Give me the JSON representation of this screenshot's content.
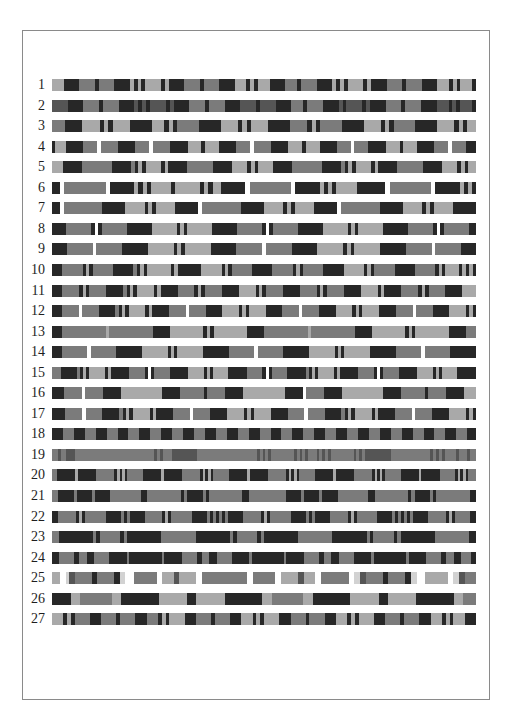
{
  "figure": {
    "palette": {
      "L": "#a9a9a9",
      "M": "#7b7b7b",
      "D": "#272727",
      "W": "#ffffff",
      "P": "#d2d2d2",
      "G": "#555555"
    },
    "rows": [
      {
        "label": "1",
        "pattern": "L3 D4 M4 D1 M4 D4 L1 D1 L1 D1 L4 D1 L1 D1 D3 M4 D1 M4 D4 L3 D1 L1 D1 L3 D4 M3 D1 M4 D4 L1 D1 L1 D1 L4 D1 L1 D4 M4 D1 M4 D4 L3 D1 L1 D1 L3 D1"
      },
      {
        "label": "2",
        "pattern": "G4 D4 M4 D1 M4 D4 G1 D1 G1 D1 G4 D1 G1 D4 M4 D1 M4 D4 G4 D1 G4 D4 M3 D1 M4 D4 G1 D1 G4 D1 G1 D4 M4 D1 M4 D4 G3 D1 G1 D1 G3 D1"
      },
      {
        "label": "3",
        "pattern": "M3 D4 L4 D1 L1 D1 L4 D5 L3 D1 L1 D1 M5 D5 L4 D1 L1 D1 L4 D5 M4 D1 L1 D1 M5 D5 L4 D1 L1 D1 M5 D5 L4 D1 L1 D1 L2"
      },
      {
        "label": "4",
        "pattern": "D1 L3 D5 M4 W1 M5 D5 M4 W1 M5 D5 L4 D1 L4 D5 M4 W1 M5 D5 L4 D1 L4 D5 M4 W1 M4 D5 L4 D1 L4 D5 M4 W1 M4 D3"
      },
      {
        "label": "5",
        "pattern": "L3 D5 M8 D5 M1 D1 L1 D1 L4 D1 L1 D5 M7 D5 L4 D1 L1 D1 L4 D5 M8 D5 M1 D1 L1 D1 L4 D1 L1 D5 M7 D5 L4 D1 L1 D1 L2"
      },
      {
        "label": "6",
        "pattern": "D2 W1 M10 W1 D6 L1 D1 L1 D1 L5 D1 L6 D1 L1 D1 L2 D6 W1 M10 W1 D6 L1 D1 L1 D1 L5 D7 W1 M10 W1 D6 L1 D1 L1 D1"
      },
      {
        "label": "7",
        "pattern": "D2 W1 M10 D6 L5 D1 L1 D1 L5 D6 W1 M10 D6 L5 D1 L1 D1 L5 D6 W1 M10 D6 L5 D1 L1 D1 L5 D6"
      },
      {
        "label": "8",
        "pattern": "D4 M7 D1 W1 D1 M7 D7 L7 D1 L1 D1 L7 D7 M7 D1 W1 D1 M7 D7 L7 D1 L1 D1 L7 D7 M7 D1 W1 D1 M7 D2"
      },
      {
        "label": "9",
        "pattern": "D4 M7 W1 M7 D7 L7 D1 L1 D1 L7 D7 M7 W1 M7 D7 L7 D1 L1 D1 L7 D7 M7 W1 M7 D4"
      },
      {
        "label": "10",
        "pattern": "D3 M6 D1 L1 D1 M6 D6 M1 D1 L1 D1 L7 D1 L1 D1 D6 L6 D1 L1 D1 M6 D6 M6 D1 L1 D1 M6 D6 L6 D1 L1 D1 M6 D6 M6 D1 L1 D1 L4 D1 L1 D1 L1 D1"
      },
      {
        "label": "11",
        "pattern": "D3 M5 D1 L1 D1 M5 D5 M1 D1 L1 D1 L5 D1 L1 D5 M5 D1 L1 D1 M5 D5 L5 D1 L1 D1 M5 D5 M5 D1 L1 D1 M5 D5 L5 D1 L1 D5 M5 D1 L1 D1 M5 D5 L4"
      },
      {
        "label": "12",
        "pattern": "D3 M5 W1 M5 D5 M1 D1 L1 D1 L5 D1 L1 D5 M5 W1 M5 D5 L5 D1 L1 D1 L5 D5 M5 W1 M5 D5 L5 D1 L1 D1 L5 D5 M5 W1 M5 D5 L5 D1 L1 D1"
      },
      {
        "label": "13",
        "pattern": "D3 M13 L1 M13 D5 L10 D1 L1 D1 L10 D5 M13 L1 M13 D5 L10 D1 L1 D1 L10 D5 M3"
      },
      {
        "label": "14",
        "pattern": "D3 M8 W1 M8 D8 L8 D1 L1 D1 L8 D8 M8 W1 M8 D8 L8 D1 L1 D1 L8 D8 M8 W1 M8 D8"
      },
      {
        "label": "15",
        "pattern": "M3 D5 M1 D1 L1 D1 L5 D1 L1 D1 D5 M5 D1 W1 D1 M5 D6 L5 D1 L1 D1 L5 D6 M5 D1 W1 D1 M5 D6 M1 D1 L1 D1 L5 D1 L1 D1 D5 M5 D1 W1 D1 M5 D6 L5 D1 L1 D1 L5 D6"
      },
      {
        "label": "16",
        "pattern": "D4 M6 W1 M6 D6 L14 D6 M8 D1 M6 D6 L14 D6 W1 M6 D6 L14 D6 M8 D1 M6 D6 L4"
      },
      {
        "label": "17",
        "pattern": "D4 M5 W1 M5 D5 M1 D1 L1 D1 L5 D1 L1 D5 M5 W1 M5 D5 L5 D1 L1 D1 L5 D5 M5 W1 M5 D5 M1 D1 L1 D1 L5 D1 L1 D5 M5 W1 M5 D5 L5 D1 L1 D1"
      },
      {
        "label": "18",
        "pattern": "D5 M5 D5 M5 D5 M5 D5 M5 D5 M5 D5 M5 D5 M5 D5 M5 D5 M5 D5 M5 D5 M5 D5 M5 D5 M5 D5 M5 D5 M5 D5 M5 D5 M5 D5 M5 D5 M5 D4"
      },
      {
        "label": "19",
        "pattern": "M2 G1 M2 G3 M28 G1 M1 G1 M3 G9 M21 G1 M1 G1 M1 G1 M8 G1 M1 G1 M1 G1 M3 G1 M1 G1 M1 G1 M8 G1 M1 G1 M1 G9 M14 G1 M1 G1 M1 G1 M4 G1 M3 G1 M2"
      },
      {
        "label": "20",
        "pattern": "M2 D7 L1 D7 M7 D1 L1 D1 L1 D1 M6 D7 L1 D7 M7 D1 L1 D1 L1 D1 M6 D7 L1 D7 M7 D1 L1 D1 L1 D1 M6 D7 L1 D7 M7 D1 L1 D1 L1 D1 M6 D7 L1 D7 M6 D1 L1 D1 L1 D1 M3"
      },
      {
        "label": "21",
        "pattern": "M2 D5 M1 D5 M1 D5 M10 D2 M11 D1 M1 D5 M1 D1 M11 D2 M12 D5 M1 D5 M1 D5 M10 D2 M11 D1 M1 D5 M1 D1 M11 D2"
      },
      {
        "label": "22",
        "pattern": "D2 M6 D1 L1 D1 M7 D5 M1 D1 M1 D5 M6 D1 L1 D1 M7 D5 M1 D1 M1 D1 M1 D1 M1 D5 M6 D1 L1 D1 M7 D5 M1 D1 M1 D5 M6 D1 L1 D1 M7 D5 M1 D1 M1 D1 M1 D1 M1 D5 M6 D1 L1 D1 M5 D2"
      },
      {
        "label": "23",
        "pattern": "M2 D10 M1 D1 M6 D1 M1 D10 M10 D10 M1 D1 M6 D1 M1 D10 M10 D10 M1 D1 M6 D1 M1 D10 M10 D2"
      },
      {
        "label": "24",
        "pattern": "D3 M6 D2 M3 D3 M6 D7 M1 D13 M1 D7 M6 D2 M3 D3 M6 D7 M1 D13 M1 D7 M6 D2 M3 D3 M6 D7 M1 D13 M1 D7 M6 D2 M3 D3 M4 D2"
      },
      {
        "label": "25",
        "pattern": "L3 W2 P1 G2 M6 D2 M6 D2 P2 W3 M8 W2 L4 G2 L6 W2 M16 W2 M8 W2 L6 G2 L4 W2 M10 W2 P2 G2 M6 D2 M6 D2 P2 W3 L8 W2 P2 G2 M4"
      },
      {
        "label": "26",
        "pattern": "D6 L3 M10 L3 D12 L9 D3 L9 D12 L3 M10 L3 D12 L9 D3 L9 D12 L3 M4"
      },
      {
        "label": "27",
        "pattern": "L3 D1 L1 D1 M4 D3 M4 D1 M4 D3 M3 D1 L1 D1 L4 D3 M4 D1 M4 D3 L3 D1 L1 D1 L4 D3 M4 D1 M4 D3 L3 D1 L1 D1 L4 D3 M4 D1 M4 D3 L3 D1 L1 D1 L3 D3"
      }
    ]
  }
}
